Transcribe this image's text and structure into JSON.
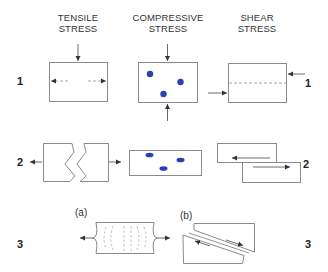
{
  "columns": [
    {
      "id": "tensile",
      "line1": "TENSILE",
      "line2": "STRESS"
    },
    {
      "id": "compressive",
      "line1": "COMPRESSIVE",
      "line2": "STRESS"
    },
    {
      "id": "shear",
      "line1": "SHEAR",
      "line2": "STRESS"
    }
  ],
  "rows": [
    {
      "label": "1",
      "description": "stress applied to block"
    },
    {
      "label": "2",
      "description": "resulting deformation"
    },
    {
      "label": "3",
      "description": "rock behavior examples"
    }
  ],
  "row3": {
    "sub_a": "(a)",
    "sub_b": "(b)"
  },
  "colors": {
    "outline": "#8a8a8a",
    "arrow": "#444444",
    "dashed": "#9a9a9a",
    "dot": "#2b3fb4"
  }
}
